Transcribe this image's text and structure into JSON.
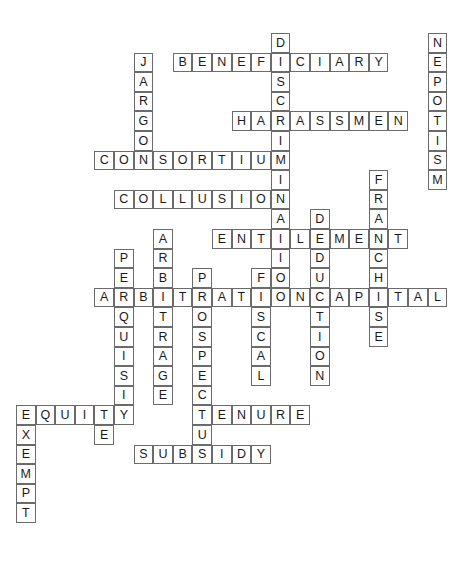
{
  "puzzle": {
    "type": "crossword",
    "title": "Crossword Puzzle Grid",
    "grid": {
      "cell_size": 19.6,
      "origin_x": 16,
      "origin_y": 33,
      "columns": 22,
      "rows": 26
    },
    "entries": [
      {
        "id": "discrimination",
        "answer": "DISCRIMINATION",
        "direction": "down",
        "col": 13,
        "row": 0,
        "length": 14
      },
      {
        "id": "nepotism",
        "answer": "NEPOTISM",
        "direction": "down",
        "col": 21,
        "row": 0,
        "length": 8
      },
      {
        "id": "jargon",
        "answer": "JARGON",
        "direction": "down",
        "col": 6,
        "row": 1,
        "length": 6
      },
      {
        "id": "beneficiary",
        "answer": "BENEFICIARY",
        "direction": "across",
        "col": 8,
        "row": 1,
        "length": 11
      },
      {
        "id": "harassment",
        "answer": "HARASSMENT",
        "direction": "across",
        "col": 11,
        "row": 4,
        "length": 10
      },
      {
        "id": "consortium",
        "answer": "CONSORTIUM",
        "direction": "across",
        "col": 4,
        "row": 6,
        "length": 10
      },
      {
        "id": "franchise",
        "answer": "FRANCHISE",
        "direction": "down",
        "col": 18,
        "row": 7,
        "length": 9
      },
      {
        "id": "collusion",
        "answer": "COLLUSION",
        "direction": "across",
        "col": 5,
        "row": 8,
        "length": 9
      },
      {
        "id": "deduction",
        "answer": "DEDUCTION",
        "direction": "down",
        "col": 15,
        "row": 9,
        "length": 9
      },
      {
        "id": "arbitrage",
        "answer": "ARBITRAGE",
        "direction": "down",
        "col": 7,
        "row": 10,
        "length": 9
      },
      {
        "id": "entitlement",
        "answer": "ENTITLEMENT",
        "direction": "across",
        "col": 10,
        "row": 10,
        "length": 11
      },
      {
        "id": "perquisite",
        "answer": "PERQUISITE",
        "direction": "down",
        "col": 5,
        "row": 11,
        "length": 10
      },
      {
        "id": "prospectus",
        "answer": "PROSPECTUS",
        "direction": "down",
        "col": 9,
        "row": 12,
        "length": 10
      },
      {
        "id": "fiscal",
        "answer": "FISCAL",
        "direction": "down",
        "col": 12,
        "row": 12,
        "length": 6
      },
      {
        "id": "arbitration",
        "answer": "ARBITRATION",
        "direction": "across",
        "col": 4,
        "row": 13,
        "length": 11
      },
      {
        "id": "capital",
        "answer": "CAPITAL",
        "direction": "across",
        "col": 15,
        "row": 13,
        "length": 7
      },
      {
        "id": "equity",
        "answer": "EQUITY",
        "direction": "across",
        "col": 0,
        "row": 19,
        "length": 6
      },
      {
        "id": "tenure",
        "answer": "TENURE",
        "direction": "across",
        "col": 9,
        "row": 19,
        "length": 6
      },
      {
        "id": "exempt",
        "answer": "EXEMPT",
        "direction": "down",
        "col": 0,
        "row": 19,
        "length": 6
      },
      {
        "id": "subsidy",
        "answer": "SUBSIDY",
        "direction": "across",
        "col": 6,
        "row": 21,
        "length": 7
      }
    ],
    "cells": [
      {
        "l": "D",
        "c": 13,
        "r": 0
      },
      {
        "l": "N",
        "c": 21,
        "r": 0
      },
      {
        "l": "J",
        "c": 6,
        "r": 1
      },
      {
        "l": "B",
        "c": 8,
        "r": 1
      },
      {
        "l": "E",
        "c": 9,
        "r": 1
      },
      {
        "l": "N",
        "c": 10,
        "r": 1
      },
      {
        "l": "E",
        "c": 11,
        "r": 1
      },
      {
        "l": "F",
        "c": 12,
        "r": 1
      },
      {
        "l": "I",
        "c": 13,
        "r": 1
      },
      {
        "l": "C",
        "c": 14,
        "r": 1
      },
      {
        "l": "I",
        "c": 15,
        "r": 1
      },
      {
        "l": "A",
        "c": 16,
        "r": 1
      },
      {
        "l": "R",
        "c": 17,
        "r": 1
      },
      {
        "l": "Y",
        "c": 18,
        "r": 1
      },
      {
        "l": "E",
        "c": 21,
        "r": 1
      },
      {
        "l": "A",
        "c": 6,
        "r": 2
      },
      {
        "l": "S",
        "c": 13,
        "r": 2
      },
      {
        "l": "P",
        "c": 21,
        "r": 2
      },
      {
        "l": "R",
        "c": 6,
        "r": 3
      },
      {
        "l": "C",
        "c": 13,
        "r": 3
      },
      {
        "l": "O",
        "c": 21,
        "r": 3
      },
      {
        "l": "G",
        "c": 6,
        "r": 4
      },
      {
        "l": "H",
        "c": 11,
        "r": 4
      },
      {
        "l": "A",
        "c": 12,
        "r": 4
      },
      {
        "l": "R",
        "c": 13,
        "r": 4
      },
      {
        "l": "A",
        "c": 14,
        "r": 4
      },
      {
        "l": "S",
        "c": 15,
        "r": 4
      },
      {
        "l": "S",
        "c": 16,
        "r": 4
      },
      {
        "l": "M",
        "c": 17,
        "r": 4
      },
      {
        "l": "E",
        "c": 18,
        "r": 4
      },
      {
        "l": "N",
        "c": 19,
        "r": 4
      },
      {
        "l": "T",
        "c": 21,
        "r": 4
      },
      {
        "l": "O",
        "c": 6,
        "r": 5
      },
      {
        "l": "I",
        "c": 13,
        "r": 5
      },
      {
        "l": "I",
        "c": 21,
        "r": 5
      },
      {
        "l": "C",
        "c": 4,
        "r": 6
      },
      {
        "l": "O",
        "c": 5,
        "r": 6
      },
      {
        "l": "N",
        "c": 6,
        "r": 6
      },
      {
        "l": "S",
        "c": 7,
        "r": 6
      },
      {
        "l": "O",
        "c": 8,
        "r": 6
      },
      {
        "l": "R",
        "c": 9,
        "r": 6
      },
      {
        "l": "T",
        "c": 10,
        "r": 6
      },
      {
        "l": "I",
        "c": 11,
        "r": 6
      },
      {
        "l": "U",
        "c": 12,
        "r": 6
      },
      {
        "l": "M",
        "c": 13,
        "r": 6
      },
      {
        "l": "S",
        "c": 21,
        "r": 6
      },
      {
        "l": "I",
        "c": 13,
        "r": 7
      },
      {
        "l": "F",
        "c": 18,
        "r": 7
      },
      {
        "l": "M",
        "c": 21,
        "r": 7
      },
      {
        "l": "C",
        "c": 5,
        "r": 8
      },
      {
        "l": "O",
        "c": 6,
        "r": 8
      },
      {
        "l": "L",
        "c": 7,
        "r": 8
      },
      {
        "l": "L",
        "c": 8,
        "r": 8
      },
      {
        "l": "U",
        "c": 9,
        "r": 8
      },
      {
        "l": "S",
        "c": 10,
        "r": 8
      },
      {
        "l": "I",
        "c": 11,
        "r": 8
      },
      {
        "l": "O",
        "c": 12,
        "r": 8
      },
      {
        "l": "N",
        "c": 13,
        "r": 8
      },
      {
        "l": "R",
        "c": 18,
        "r": 8
      },
      {
        "l": "A",
        "c": 13,
        "r": 9
      },
      {
        "l": "D",
        "c": 15,
        "r": 9
      },
      {
        "l": "A",
        "c": 18,
        "r": 9
      },
      {
        "l": "A",
        "c": 7,
        "r": 10
      },
      {
        "l": "E",
        "c": 10,
        "r": 10
      },
      {
        "l": "N",
        "c": 11,
        "r": 10
      },
      {
        "l": "T",
        "c": 12,
        "r": 10
      },
      {
        "l": "I",
        "c": 13,
        "r": 10
      },
      {
        "l": "T",
        "c": 13,
        "r": 10
      },
      {
        "l": "L",
        "c": 14,
        "r": 10
      },
      {
        "l": "E",
        "c": 15,
        "r": 10
      },
      {
        "l": "M",
        "c": 16,
        "r": 10
      },
      {
        "l": "E",
        "c": 17,
        "r": 10
      },
      {
        "l": "N",
        "c": 18,
        "r": 10
      },
      {
        "l": "T",
        "c": 19,
        "r": 10
      },
      {
        "l": "P",
        "c": 5,
        "r": 11
      },
      {
        "l": "R",
        "c": 7,
        "r": 11
      },
      {
        "l": "I",
        "c": 13,
        "r": 11
      },
      {
        "l": "D",
        "c": 15,
        "r": 11
      },
      {
        "l": "C",
        "c": 18,
        "r": 11
      },
      {
        "l": "E",
        "c": 5,
        "r": 12
      },
      {
        "l": "B",
        "c": 7,
        "r": 12
      },
      {
        "l": "P",
        "c": 9,
        "r": 12
      },
      {
        "l": "F",
        "c": 12,
        "r": 12
      },
      {
        "l": "O",
        "c": 13,
        "r": 12
      },
      {
        "l": "U",
        "c": 15,
        "r": 12
      },
      {
        "l": "H",
        "c": 18,
        "r": 12
      },
      {
        "l": "A",
        "c": 4,
        "r": 13
      },
      {
        "l": "R",
        "c": 5,
        "r": 13
      },
      {
        "l": "B",
        "c": 6,
        "r": 13
      },
      {
        "l": "I",
        "c": 7,
        "r": 13
      },
      {
        "l": "T",
        "c": 8,
        "r": 13
      },
      {
        "l": "R",
        "c": 9,
        "r": 13
      },
      {
        "l": "A",
        "c": 10,
        "r": 13
      },
      {
        "l": "T",
        "c": 11,
        "r": 13
      },
      {
        "l": "I",
        "c": 12,
        "r": 13
      },
      {
        "l": "O",
        "c": 13,
        "r": 13
      },
      {
        "l": "N",
        "c": 14,
        "r": 13
      },
      {
        "l": "C",
        "c": 15,
        "r": 13
      },
      {
        "l": "A",
        "c": 16,
        "r": 13
      },
      {
        "l": "P",
        "c": 17,
        "r": 13
      },
      {
        "l": "I",
        "c": 18,
        "r": 13
      },
      {
        "l": "T",
        "c": 19,
        "r": 13
      },
      {
        "l": "A",
        "c": 20,
        "r": 13
      },
      {
        "l": "L",
        "c": 21,
        "r": 13
      },
      {
        "l": "Q",
        "c": 5,
        "r": 14
      },
      {
        "l": "T",
        "c": 7,
        "r": 14
      },
      {
        "l": "O",
        "c": 9,
        "r": 14
      },
      {
        "l": "S",
        "c": 12,
        "r": 14
      },
      {
        "l": "T",
        "c": 15,
        "r": 14
      },
      {
        "l": "S",
        "c": 18,
        "r": 14
      },
      {
        "l": "U",
        "c": 5,
        "r": 15
      },
      {
        "l": "R",
        "c": 7,
        "r": 15
      },
      {
        "l": "S",
        "c": 9,
        "r": 15
      },
      {
        "l": "C",
        "c": 12,
        "r": 15
      },
      {
        "l": "I",
        "c": 15,
        "r": 15
      },
      {
        "l": "E",
        "c": 18,
        "r": 15
      },
      {
        "l": "I",
        "c": 5,
        "r": 16
      },
      {
        "l": "A",
        "c": 7,
        "r": 16
      },
      {
        "l": "P",
        "c": 9,
        "r": 16
      },
      {
        "l": "A",
        "c": 12,
        "r": 16
      },
      {
        "l": "O",
        "c": 15,
        "r": 16
      },
      {
        "l": "S",
        "c": 5,
        "r": 17
      },
      {
        "l": "G",
        "c": 7,
        "r": 17
      },
      {
        "l": "E",
        "c": 9,
        "r": 17
      },
      {
        "l": "L",
        "c": 12,
        "r": 17
      },
      {
        "l": "N",
        "c": 15,
        "r": 17
      },
      {
        "l": "I",
        "c": 5,
        "r": 18
      },
      {
        "l": "E",
        "c": 7,
        "r": 18
      },
      {
        "l": "C",
        "c": 9,
        "r": 18
      },
      {
        "l": "E",
        "c": 0,
        "r": 19
      },
      {
        "l": "Q",
        "c": 1,
        "r": 19
      },
      {
        "l": "U",
        "c": 2,
        "r": 19
      },
      {
        "l": "I",
        "c": 3,
        "r": 19
      },
      {
        "l": "T",
        "c": 4,
        "r": 19
      },
      {
        "l": "Y",
        "c": 5,
        "r": 19
      },
      {
        "l": "T",
        "c": 9,
        "r": 19
      },
      {
        "l": "E",
        "c": 10,
        "r": 19
      },
      {
        "l": "N",
        "c": 11,
        "r": 19
      },
      {
        "l": "U",
        "c": 12,
        "r": 19
      },
      {
        "l": "R",
        "c": 13,
        "r": 19
      },
      {
        "l": "E",
        "c": 14,
        "r": 19
      },
      {
        "l": "X",
        "c": 0,
        "r": 20
      },
      {
        "l": "E",
        "c": 4,
        "r": 20
      },
      {
        "l": "U",
        "c": 9,
        "r": 20
      },
      {
        "l": "E",
        "c": 0,
        "r": 21
      },
      {
        "l": "S",
        "c": 6,
        "r": 21
      },
      {
        "l": "U",
        "c": 7,
        "r": 21
      },
      {
        "l": "B",
        "c": 8,
        "r": 21
      },
      {
        "l": "S",
        "c": 9,
        "r": 21
      },
      {
        "l": "I",
        "c": 10,
        "r": 21
      },
      {
        "l": "D",
        "c": 11,
        "r": 21
      },
      {
        "l": "Y",
        "c": 12,
        "r": 21
      },
      {
        "l": "M",
        "c": 0,
        "r": 22
      },
      {
        "l": "P",
        "c": 0,
        "r": 23
      },
      {
        "l": "T",
        "c": 0,
        "r": 24
      }
    ]
  },
  "colors": {
    "cell_border": "#6b6b6b",
    "cell_fill": "#ffffff",
    "letter": "#1a1a1a",
    "background": "#ffffff"
  }
}
